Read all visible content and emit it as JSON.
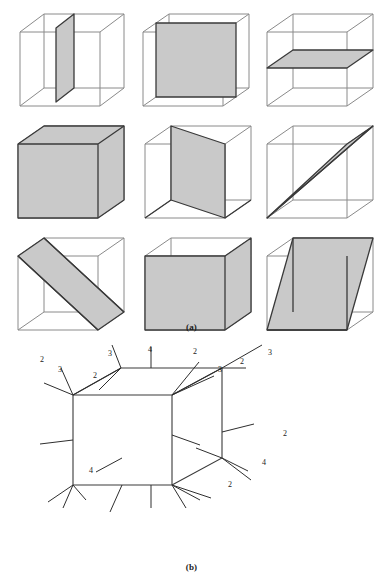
{
  "figure": {
    "panels": [
      {
        "id": "a",
        "caption": "(a)",
        "description": "Nine wireframe cubes each showing a shaded planar cross-section",
        "rows": 3,
        "cols": 3,
        "cubes": [
          {
            "index": 1,
            "row": 1,
            "col": 1,
            "section_name": "vertical-plane-parallel-to-side-face",
            "section_shape": "square"
          },
          {
            "index": 2,
            "row": 1,
            "col": 2,
            "section_name": "vertical-plane-parallel-to-front-face",
            "section_shape": "square"
          },
          {
            "index": 3,
            "row": 1,
            "col": 3,
            "section_name": "horizontal-plane-parallel-to-top-face",
            "section_shape": "square"
          },
          {
            "index": 4,
            "row": 2,
            "col": 1,
            "section_name": "diagonal-plane-top-back-to-bottom-front",
            "section_shape": "rectangle"
          },
          {
            "index": 5,
            "row": 2,
            "col": 2,
            "section_name": "vertical-plane-through-base-diagonal",
            "section_shape": "rectangle"
          },
          {
            "index": 6,
            "row": 2,
            "col": 3,
            "section_name": "narrow-plane-through-space-diagonal",
            "section_shape": "sliver"
          },
          {
            "index": 7,
            "row": 3,
            "col": 1,
            "section_name": "oblique-band-across-cube",
            "section_shape": "parallelogram"
          },
          {
            "index": 8,
            "row": 3,
            "col": 2,
            "section_name": "oblique-plane-cutting-four-edges",
            "section_shape": "hexagon"
          },
          {
            "index": 9,
            "row": 3,
            "col": 3,
            "section_name": "slanted-parallelogram-plane",
            "section_shape": "parallelogram"
          }
        ]
      },
      {
        "id": "b",
        "caption": "(b)",
        "description": "Single cube with numbered leader lines radiating from its vertices and faces",
        "labels": [
          {
            "id": "lbl-top-left-3",
            "value": "3",
            "x": 58,
            "y": 32
          },
          {
            "id": "lbl-top-left-2",
            "value": "2",
            "x": 40,
            "y": 22
          },
          {
            "id": "lbl-top-mid-2",
            "value": "2",
            "x": 93,
            "y": 38
          },
          {
            "id": "lbl-top-apex-3",
            "value": "3",
            "x": 108,
            "y": 16
          },
          {
            "id": "lbl-top-4",
            "value": "4",
            "x": 148,
            "y": 12
          },
          {
            "id": "lbl-top-right-2",
            "value": "2",
            "x": 193,
            "y": 14
          },
          {
            "id": "lbl-right-3a",
            "value": "3",
            "x": 218,
            "y": 32
          },
          {
            "id": "lbl-right-2a",
            "value": "2",
            "x": 240,
            "y": 24
          },
          {
            "id": "lbl-right-3b",
            "value": "3",
            "x": 268,
            "y": 15
          },
          {
            "id": "lbl-side-2",
            "value": "2",
            "x": 283,
            "y": 96
          },
          {
            "id": "lbl-side-4",
            "value": "4",
            "x": 262,
            "y": 125
          },
          {
            "id": "lbl-face-4",
            "value": "4",
            "x": 89,
            "y": 133
          },
          {
            "id": "lbl-lower-2",
            "value": "2",
            "x": 228,
            "y": 147
          }
        ],
        "label_values": [
          "3",
          "2",
          "2",
          "3",
          "4",
          "2",
          "3",
          "2",
          "3",
          "2",
          "4",
          "4",
          "2"
        ]
      }
    ]
  },
  "style": {
    "background": "#ffffff",
    "edge_color": "#8a8a8a",
    "edge_dark_color": "#3a3a3a",
    "section_fill": "#c9c9c9",
    "label_color": "#1a1a1a"
  }
}
